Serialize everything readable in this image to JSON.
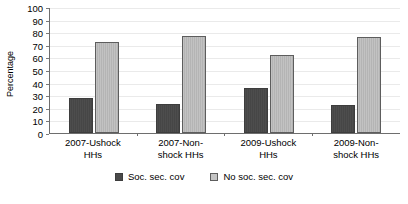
{
  "chart_data": {
    "type": "bar",
    "title": "",
    "xlabel": "",
    "ylabel": "Percentage",
    "ylim": [
      0,
      100
    ],
    "ytick_step": 10,
    "yticks": [
      100,
      90,
      80,
      70,
      60,
      50,
      40,
      30,
      20,
      10,
      0
    ],
    "grid": true,
    "legend_position": "bottom",
    "categories": [
      "2007-Ushock\nHHs",
      "2007-Non-\nshock HHs",
      "2009-Ushock\nHHs",
      "2009-Non-\nshock HHs"
    ],
    "series": [
      {
        "name": "Soc. sec. cov",
        "color": "#4a4a4a",
        "values": [
          28,
          23,
          36,
          22
        ]
      },
      {
        "name": "No soc. sec. cov",
        "color": "#c4c4c4",
        "values": [
          72,
          77,
          62,
          76
        ]
      }
    ]
  }
}
